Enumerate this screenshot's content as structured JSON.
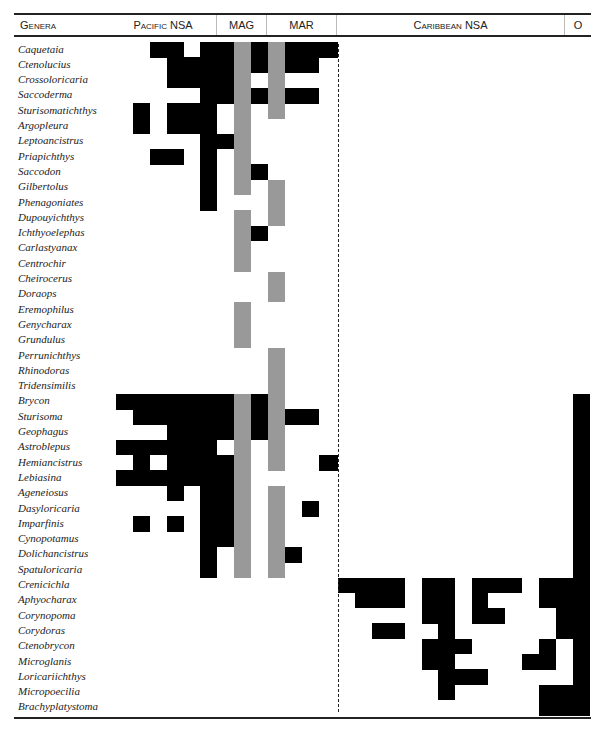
{
  "header": {
    "genera": "Genera",
    "pacific": "Pacific NSA",
    "mag": "MAG",
    "mar": "MAR",
    "caribbean": "Caribbean NSA",
    "o": "O"
  },
  "colors": {
    "presence": "#000000",
    "shared": "#999999",
    "background": "#ffffff"
  },
  "grid": {
    "origin_y": 42,
    "row_h": 15.3,
    "col_starts": [
      116,
      133,
      150,
      167,
      184,
      200,
      217,
      234,
      251,
      268,
      285,
      302,
      319,
      338,
      355,
      372,
      388,
      405,
      422,
      438,
      455,
      472,
      488,
      505,
      522,
      539,
      556,
      573
    ],
    "col_width": 17,
    "columns": [
      "P0",
      "P1",
      "P2",
      "P3",
      "P4",
      "P5",
      "A0",
      "A1",
      "A2",
      "R0",
      "R1",
      "R2",
      "R3",
      "C0",
      "C1",
      "C2",
      "C3",
      "C4",
      "C5",
      "C6",
      "C7",
      "C8",
      "C9",
      "C10",
      "C11",
      "C12",
      "C13",
      "O"
    ]
  },
  "genera": [
    {
      "name": "Caquetaia",
      "b": [
        2,
        3,
        5,
        6,
        8,
        10,
        11,
        12
      ],
      "g": [
        7,
        9
      ]
    },
    {
      "name": "Ctenolucius",
      "b": [
        3,
        4,
        5,
        6,
        8,
        10,
        11
      ],
      "g": [
        7,
        9
      ]
    },
    {
      "name": "Crossoloricaria",
      "b": [
        3,
        4,
        5,
        6
      ],
      "g": [
        7,
        9
      ]
    },
    {
      "name": "Saccoderma",
      "b": [
        5,
        6,
        8,
        10,
        11
      ],
      "g": [
        7,
        9
      ]
    },
    {
      "name": "Sturisomatichthys",
      "b": [
        1,
        3,
        4,
        5
      ],
      "g": [
        7,
        9
      ]
    },
    {
      "name": "Argopleura",
      "b": [
        1,
        3,
        4,
        5
      ],
      "g": [
        7
      ]
    },
    {
      "name": "Leptoancistrus",
      "b": [
        5,
        6
      ],
      "g": [
        7
      ]
    },
    {
      "name": "Priapichthys",
      "b": [
        2,
        3,
        5
      ],
      "g": [
        7
      ]
    },
    {
      "name": "Saccodon",
      "b": [
        5,
        8
      ],
      "g": [
        7
      ]
    },
    {
      "name": "Gilbertolus",
      "b": [
        5
      ],
      "g": [
        7,
        9
      ]
    },
    {
      "name": "Phenagoniates",
      "b": [
        5
      ],
      "g": [
        9
      ]
    },
    {
      "name": "Dupouyichthys",
      "b": [],
      "g": [
        7,
        9
      ]
    },
    {
      "name": "Ichthyoelephas",
      "b": [
        8
      ],
      "g": [
        7
      ]
    },
    {
      "name": "Carlastyanax",
      "b": [],
      "g": [
        7
      ]
    },
    {
      "name": "Centrochir",
      "b": [],
      "g": [
        7
      ]
    },
    {
      "name": "Cheirocerus",
      "b": [],
      "g": [
        9
      ]
    },
    {
      "name": "Doraops",
      "b": [],
      "g": [
        9
      ]
    },
    {
      "name": "Eremophilus",
      "b": [],
      "g": [
        7
      ]
    },
    {
      "name": "Genycharax",
      "b": [],
      "g": [
        7
      ]
    },
    {
      "name": "Grundulus",
      "b": [],
      "g": [
        7
      ]
    },
    {
      "name": "Perrunichthys",
      "b": [],
      "g": [
        9
      ]
    },
    {
      "name": "Rhinodoras",
      "b": [],
      "g": [
        9
      ]
    },
    {
      "name": "Tridensimilis",
      "b": [],
      "g": [
        9
      ]
    },
    {
      "name": "Brycon",
      "b": [
        0,
        1,
        2,
        3,
        4,
        5,
        6,
        8,
        27
      ],
      "g": [
        7,
        9
      ]
    },
    {
      "name": "Sturisoma",
      "b": [
        1,
        2,
        3,
        4,
        5,
        6,
        8,
        10,
        11,
        27
      ],
      "g": [
        7,
        9
      ]
    },
    {
      "name": "Geophagus",
      "b": [
        3,
        4,
        5,
        6,
        8,
        27
      ],
      "g": [
        7,
        9
      ]
    },
    {
      "name": "Astroblepus",
      "b": [
        0,
        1,
        2,
        3,
        4,
        5,
        27
      ],
      "g": [
        7,
        9
      ]
    },
    {
      "name": "Hemiancistrus",
      "b": [
        1,
        3,
        4,
        5,
        6,
        12,
        27
      ],
      "g": [
        7,
        9
      ]
    },
    {
      "name": "Lebiasina",
      "b": [
        0,
        1,
        2,
        3,
        4,
        5,
        6,
        27
      ],
      "g": [
        7
      ]
    },
    {
      "name": "Ageneiosus",
      "b": [
        3,
        5,
        6,
        27
      ],
      "g": [
        7,
        9
      ]
    },
    {
      "name": "Dasyloricaria",
      "b": [
        5,
        6,
        11,
        27
      ],
      "g": [
        7,
        9
      ]
    },
    {
      "name": "Imparfinis",
      "b": [
        1,
        3,
        5,
        6,
        27
      ],
      "g": [
        7,
        9
      ]
    },
    {
      "name": "Cynopotamus",
      "b": [
        5,
        6,
        27
      ],
      "g": [
        7,
        9
      ]
    },
    {
      "name": "Dolichancistrus",
      "b": [
        5,
        10,
        27
      ],
      "g": [
        7,
        9
      ]
    },
    {
      "name": "Spatuloricaria",
      "b": [
        5,
        27
      ],
      "g": [
        7,
        9
      ]
    },
    {
      "name": "Crenicichla",
      "b": [
        13,
        14,
        15,
        16,
        18,
        19,
        21,
        22,
        23,
        25,
        26,
        27
      ],
      "g": []
    },
    {
      "name": "Aphyocharax",
      "b": [
        14,
        15,
        16,
        18,
        19,
        21,
        25,
        26,
        27
      ],
      "g": []
    },
    {
      "name": "Corynopoma",
      "b": [
        18,
        19,
        21,
        22,
        26,
        27
      ],
      "g": []
    },
    {
      "name": "Corydoras",
      "b": [
        15,
        16,
        19,
        26,
        27
      ],
      "g": []
    },
    {
      "name": "Ctenobrycon",
      "b": [
        18,
        19,
        20,
        25,
        27
      ],
      "g": []
    },
    {
      "name": "Microglanis",
      "b": [
        18,
        19,
        24,
        25,
        27
      ],
      "g": []
    },
    {
      "name": "Loricariichthys",
      "b": [
        19,
        20,
        21,
        27
      ],
      "g": []
    },
    {
      "name": "Micropoecilia",
      "b": [
        19,
        25,
        26,
        27
      ],
      "g": []
    },
    {
      "name": "Brachyplatystoma",
      "b": [
        25,
        26,
        27
      ],
      "g": []
    }
  ]
}
